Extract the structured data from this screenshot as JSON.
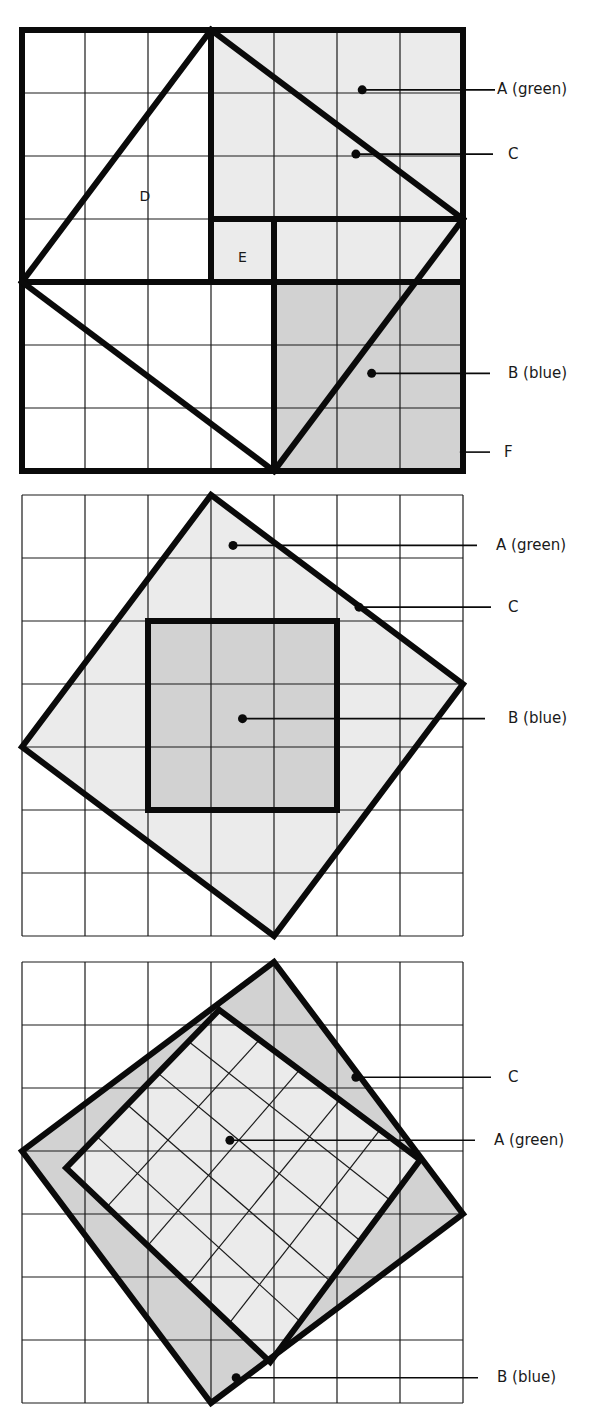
{
  "colors": {
    "background": "#ffffff",
    "grid_line": "#1a1a1a",
    "thick_line": "#0a0a0a",
    "region_light": "#ebebeb",
    "region_dark": "#d2d2d2",
    "label_text": "#1a1a1a"
  },
  "grid": {
    "cols": 7,
    "rows": 7,
    "cell": 63,
    "left": 22
  },
  "diagrams": [
    {
      "id": "diagram-1",
      "top": 30,
      "fills": [
        {
          "name": "region-a-green",
          "color": "light",
          "points": [
            [
              3,
              0
            ],
            [
              7,
              0
            ],
            [
              7,
              3
            ],
            [
              3,
              3
            ]
          ]
        },
        {
          "name": "region-e",
          "color": "light",
          "points": [
            [
              3,
              3
            ],
            [
              4,
              3
            ],
            [
              4,
              4
            ],
            [
              3,
              4
            ]
          ]
        },
        {
          "name": "region-top-right-strip",
          "color": "light",
          "points": [
            [
              4,
              3
            ],
            [
              7,
              3
            ],
            [
              7,
              4
            ],
            [
              4,
              4
            ]
          ]
        },
        {
          "name": "region-b-blue",
          "color": "dark",
          "points": [
            [
              4,
              4
            ],
            [
              7,
              4
            ],
            [
              7,
              7
            ],
            [
              4,
              7
            ]
          ]
        }
      ],
      "thick_lines": [
        [
          [
            0,
            0
          ],
          [
            7,
            0
          ],
          [
            7,
            7
          ],
          [
            0,
            7
          ],
          [
            0,
            0
          ]
        ],
        [
          [
            3,
            0
          ],
          [
            3,
            4
          ]
        ],
        [
          [
            3,
            3
          ],
          [
            7,
            3
          ]
        ],
        [
          [
            0,
            4
          ],
          [
            7,
            4
          ]
        ],
        [
          [
            4,
            3
          ],
          [
            4,
            7
          ]
        ],
        [
          [
            3,
            0
          ],
          [
            0,
            4
          ]
        ],
        [
          [
            3,
            0
          ],
          [
            7,
            3
          ]
        ],
        [
          [
            0,
            4
          ],
          [
            4,
            7
          ]
        ],
        [
          [
            7,
            3
          ],
          [
            4,
            7
          ]
        ]
      ],
      "thin_rotated_lines": [],
      "inner_labels": [
        {
          "text": "D",
          "at": [
            1.95,
            2.65
          ]
        },
        {
          "text": "E",
          "at": [
            3.5,
            3.62
          ]
        }
      ],
      "callouts": [
        {
          "text": "A (green)",
          "dot": [
            5.4,
            0.95
          ],
          "line_end_x": 495,
          "label_x": 497,
          "dot_visible": true
        },
        {
          "text": "C",
          "dot": [
            5.3,
            1.97
          ],
          "line_end_x": 493,
          "label_x": 508,
          "dot_visible": true
        },
        {
          "text": "B (blue)",
          "dot": [
            5.55,
            5.45
          ],
          "line_end_x": 490,
          "label_x": 508,
          "dot_visible": true
        },
        {
          "text": "F",
          "dot": [
            6.95,
            6.7
          ],
          "line_end_x": 490,
          "label_x": 504,
          "dot_visible": false
        }
      ]
    },
    {
      "id": "diagram-2",
      "top": 495,
      "fills": [
        {
          "name": "region-a-green-square-c",
          "color": "light",
          "points": [
            [
              3,
              0
            ],
            [
              7,
              3
            ],
            [
              4,
              7
            ],
            [
              0,
              4
            ]
          ]
        },
        {
          "name": "region-b-blue",
          "color": "dark",
          "points": [
            [
              2,
              2
            ],
            [
              5,
              2
            ],
            [
              5,
              5
            ],
            [
              2,
              5
            ]
          ]
        }
      ],
      "thick_lines": [
        [
          [
            3,
            0
          ],
          [
            7,
            3
          ],
          [
            4,
            7
          ],
          [
            0,
            4
          ],
          [
            3,
            0
          ]
        ],
        [
          [
            2,
            2
          ],
          [
            5,
            2
          ],
          [
            5,
            5
          ],
          [
            2,
            5
          ],
          [
            2,
            2
          ]
        ]
      ],
      "thin_rotated_lines": [],
      "inner_labels": [],
      "callouts": [
        {
          "text": "A (green)",
          "dot": [
            3.35,
            0.8
          ],
          "line_end_x": 477,
          "label_x": 496,
          "dot_visible": true
        },
        {
          "text": "C",
          "dot": [
            5.35,
            1.78
          ],
          "line_end_x": 491,
          "label_x": 508,
          "dot_visible": true
        },
        {
          "text": "B (blue)",
          "dot": [
            3.5,
            3.55
          ],
          "line_end_x": 485,
          "label_x": 508,
          "dot_visible": true
        }
      ]
    },
    {
      "id": "diagram-3",
      "top": 962,
      "fills": [
        {
          "name": "region-b-blue-square-c",
          "color": "dark",
          "points": [
            [
              4,
              0
            ],
            [
              7,
              4
            ],
            [
              3,
              7
            ],
            [
              0,
              3
            ]
          ]
        },
        {
          "name": "region-a-green-inner-square",
          "color": "light",
          "points": [
            [
              3.13,
              0.76
            ],
            [
              6.32,
              3.14
            ],
            [
              3.94,
              6.35
            ],
            [
              0.7,
              3.27
            ]
          ]
        }
      ],
      "thick_lines": [
        [
          [
            4,
            0
          ],
          [
            7,
            4
          ],
          [
            3,
            7
          ],
          [
            0,
            3
          ],
          [
            4,
            0
          ]
        ],
        [
          [
            3.13,
            0.76
          ],
          [
            6.32,
            3.14
          ],
          [
            3.94,
            6.35
          ],
          [
            0.7,
            3.27
          ],
          [
            3.13,
            0.76
          ]
        ]
      ],
      "thin_rotated_lines": {
        "a": [
          3.13,
          0.76
        ],
        "b": [
          6.32,
          3.14
        ],
        "c": [
          3.94,
          6.35
        ],
        "d": [
          0.7,
          3.27
        ],
        "divisions": 5
      },
      "inner_labels": [],
      "callouts": [
        {
          "text": "C",
          "dot": [
            5.3,
            1.83
          ],
          "line_end_x": 491,
          "label_x": 508,
          "dot_visible": true
        },
        {
          "text": "A (green)",
          "dot": [
            3.3,
            2.83
          ],
          "line_end_x": 475,
          "label_x": 494,
          "dot_visible": true
        },
        {
          "text": "B (blue)",
          "dot": [
            3.4,
            6.6
          ],
          "line_end_x": 478,
          "label_x": 497,
          "dot_visible": true
        }
      ]
    }
  ]
}
